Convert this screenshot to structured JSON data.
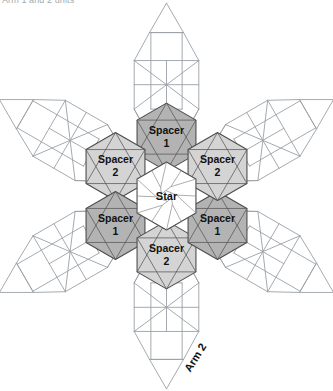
{
  "caption": {
    "text": "Arm 1 and 2 units"
  },
  "figure": {
    "center": {
      "x": 166.5,
      "y": 196
    },
    "hex_radius": 34,
    "colors": {
      "spacer1_fill": "#b3b3b3",
      "spacer2_fill": "#d4d4d4",
      "star_fill": "#ffffff",
      "hex_stroke": "#4d4d4d",
      "arm_stroke": "#9aa0a6",
      "background": "#ffffff",
      "label_color": "#111111"
    },
    "center_piece": {
      "label": "Star",
      "fill": "#ffffff",
      "pattern": "pinwheel"
    },
    "spacers": [
      {
        "label_line1": "Spacer",
        "label_line2": "1",
        "position": "top",
        "angle_deg": 90,
        "fill": "#b3b3b3"
      },
      {
        "label_line1": "Spacer",
        "label_line2": "2",
        "position": "upper-left",
        "angle_deg": 150,
        "fill": "#d4d4d4"
      },
      {
        "label_line1": "Spacer",
        "label_line2": "1",
        "position": "lower-left",
        "angle_deg": 210,
        "fill": "#b3b3b3"
      },
      {
        "label_line1": "Spacer",
        "label_line2": "2",
        "position": "bottom",
        "angle_deg": 270,
        "fill": "#d4d4d4"
      },
      {
        "label_line1": "Spacer",
        "label_line2": "1",
        "position": "lower-right",
        "angle_deg": 330,
        "fill": "#b3b3b3"
      },
      {
        "label_line1": "Spacer",
        "label_line2": "2",
        "position": "upper-right",
        "angle_deg": 30,
        "fill": "#d4d4d4"
      }
    ],
    "arms": [
      {
        "name": "arm-top",
        "angle_deg": 90,
        "label": ""
      },
      {
        "name": "arm-upper-left",
        "angle_deg": 150,
        "label": ""
      },
      {
        "name": "arm-lower-left",
        "angle_deg": 210,
        "label": ""
      },
      {
        "name": "arm-bottom",
        "angle_deg": 270,
        "label": "Arm 2"
      },
      {
        "name": "arm-lower-right",
        "angle_deg": 330,
        "label": ""
      },
      {
        "name": "arm-upper-right",
        "angle_deg": 30,
        "label": ""
      }
    ],
    "arm_label": {
      "text": "Arm 2",
      "rotation_deg": -58,
      "x": 196,
      "y": 358
    }
  }
}
